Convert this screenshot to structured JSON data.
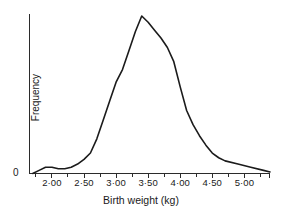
{
  "chart_data": {
    "type": "line",
    "title": "",
    "xlabel": "Birth weight (kg)",
    "ylabel": "Frequency",
    "grid": false,
    "legend": false,
    "legend_position": "none",
    "xlim": [
      1.65,
      5.4
    ],
    "ylim": [
      0,
      100
    ],
    "y_axis_numeric_ticks": [
      "0"
    ],
    "x_major_tick_labels": [
      "2·00",
      "2·50",
      "3·00",
      "3·50",
      "4·00",
      "4·50",
      "5·00"
    ],
    "x_major_tick_values": [
      2.0,
      2.5,
      3.0,
      3.5,
      4.0,
      4.5,
      5.0
    ],
    "x_minor_tick_values": [
      1.75,
      2.25,
      2.75,
      3.25,
      3.75,
      4.25,
      4.75,
      5.25
    ],
    "series": [
      {
        "name": "Birth weight frequency",
        "color": "#1b1b1b",
        "x": [
          1.7,
          1.8,
          1.9,
          2.0,
          2.1,
          2.2,
          2.3,
          2.4,
          2.5,
          2.6,
          2.7,
          2.8,
          2.9,
          3.0,
          3.1,
          3.2,
          3.3,
          3.4,
          3.5,
          3.6,
          3.7,
          3.8,
          3.9,
          4.0,
          4.1,
          4.2,
          4.3,
          4.4,
          4.5,
          4.6,
          4.7,
          4.9,
          5.1,
          5.3,
          5.4
        ],
        "y": [
          0,
          2,
          4,
          4,
          3,
          3,
          4,
          6,
          9,
          13,
          22,
          34,
          46,
          58,
          66,
          78,
          90,
          100,
          96,
          91,
          86,
          80,
          71,
          55,
          40,
          31,
          24,
          18,
          13,
          10,
          8,
          6,
          4,
          2,
          1
        ]
      }
    ],
    "annotations": {
      "peak_label": "",
      "shape": "right-skewed unimodal frequency polygon"
    }
  },
  "axis": {
    "zero_label": "0"
  }
}
